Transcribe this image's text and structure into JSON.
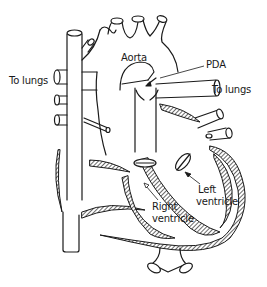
{
  "diagram": {
    "labels": {
      "aorta": "Aorta",
      "pda": "PDA",
      "to_lungs_left": "To lungs",
      "to_lungs_right": "To lungs",
      "left_ventricle_line1": "Left",
      "left_ventricle_line2": "ventricle",
      "right_ventricle_line1": "Right",
      "right_ventricle_line2": "ventricle"
    },
    "colors": {
      "stroke": "#1a1a1a",
      "background": "#ffffff",
      "hatch": "#555555"
    }
  }
}
